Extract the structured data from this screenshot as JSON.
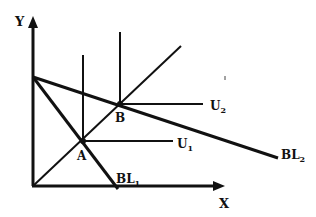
{
  "diagram": {
    "type": "economics-indifference-budget-diagram",
    "axes": {
      "x_label": "X",
      "y_label": "Y"
    },
    "points": [
      {
        "id": "A",
        "label": "A"
      },
      {
        "id": "B",
        "label": "B"
      }
    ],
    "curves": {
      "U1": {
        "base": "U",
        "sub": "1"
      },
      "U2": {
        "base": "U",
        "sub": "2"
      },
      "BL1": {
        "base": "BL",
        "sub": "1"
      },
      "BL2": {
        "base": "BL",
        "sub": "2"
      }
    },
    "colors": {
      "ink": "#111111",
      "background": "#ffffff"
    }
  }
}
